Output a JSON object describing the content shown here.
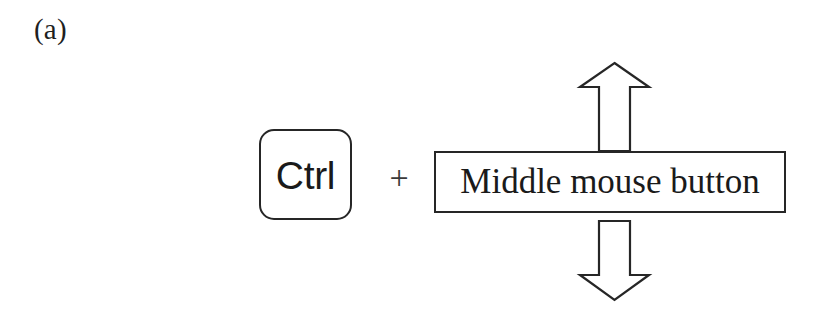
{
  "figure": {
    "panel_label": "(a)",
    "background_color": "#ffffff",
    "stroke_color": "#262626",
    "text_color": "#1a1a1a"
  },
  "shortcut": {
    "modifier_key_label": "Ctrl",
    "combine_symbol": "+",
    "action_label": "Middle mouse button",
    "arrow_up_name": "up-arrow",
    "arrow_down_name": "down-arrow"
  }
}
